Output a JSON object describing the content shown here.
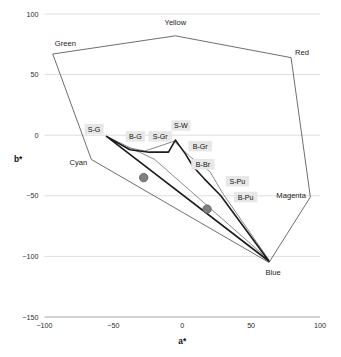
{
  "chart_data": {
    "type": "line",
    "title": "",
    "subtitle": "",
    "xlabel": "a*",
    "ylabel": "b*",
    "xlim": [
      -100,
      100
    ],
    "ylim": [
      -150,
      100
    ],
    "xticks": [
      -100,
      -50,
      0,
      50,
      100
    ],
    "xtick_labels": [
      "−100",
      "−50",
      "0",
      "50",
      "100"
    ],
    "yticks": [
      100,
      50,
      0,
      -50,
      -100,
      -150
    ],
    "ytick_labels": [
      "100",
      "50",
      "0",
      "−50",
      "−100",
      "−150"
    ],
    "grid": true,
    "legend": "none",
    "series": [
      {
        "name": "outer-gamut-boundary",
        "closed": true,
        "style": "thin-gray",
        "points": [
          [
            -94,
            67
          ],
          [
            -5,
            82
          ],
          [
            79,
            64
          ],
          [
            93,
            -51
          ],
          [
            63,
            -105
          ],
          [
            -66,
            -20
          ],
          [
            -94,
            67
          ]
        ]
      },
      {
        "name": "mid-gamut-boundary",
        "closed": true,
        "style": "medium-gray",
        "points": [
          [
            -55,
            -1
          ],
          [
            -41,
            -10
          ],
          [
            -27,
            -13
          ],
          [
            -6,
            -5
          ],
          [
            6,
            -18
          ],
          [
            20,
            -30
          ],
          [
            30,
            -49
          ],
          [
            63,
            -103
          ],
          [
            -20,
            -20
          ],
          [
            -55,
            -1
          ]
        ]
      },
      {
        "name": "inner-gamut-boundary",
        "closed": true,
        "style": "thick-black",
        "points": [
          [
            -55,
            -1
          ],
          [
            -38,
            -12
          ],
          [
            -24,
            -14
          ],
          [
            -10,
            -14
          ],
          [
            -5,
            -4
          ],
          [
            2,
            -15
          ],
          [
            8,
            -26
          ],
          [
            16,
            -36
          ],
          [
            28,
            -50
          ],
          [
            63,
            -104
          ],
          [
            -55,
            -1
          ]
        ]
      }
    ],
    "markers": [
      {
        "name": "sample-point-1",
        "x": -28,
        "y": -35,
        "color": "#808080"
      },
      {
        "name": "sample-point-2",
        "x": 18,
        "y": -61,
        "color": "#808080"
      }
    ],
    "vertex_labels": [
      {
        "name": "Green",
        "x": -94,
        "y": 72,
        "anchor": "start",
        "dx": 2,
        "dy": -2
      },
      {
        "name": "Yellow",
        "x": -5,
        "y": 88,
        "anchor": "middle",
        "dx": 0,
        "dy": -4
      },
      {
        "name": "Red",
        "x": 79,
        "y": 66,
        "anchor": "start",
        "dx": 4,
        "dy": 0
      },
      {
        "name": "Magenta",
        "x": 93,
        "y": -52,
        "anchor": "start",
        "dx": -34,
        "dy": 0
      },
      {
        "name": "Blue",
        "x": 63,
        "y": -108,
        "anchor": "middle",
        "dx": 4,
        "dy": 9
      },
      {
        "name": "Cyan",
        "x": -66,
        "y": -22,
        "anchor": "end",
        "dx": -4,
        "dy": 3
      }
    ],
    "boxed_labels": [
      {
        "name": "S-G",
        "label": "S-G",
        "x": -64,
        "y": 5
      },
      {
        "name": "B-G",
        "label": "B-G",
        "x": -34,
        "y": -1
      },
      {
        "name": "S-Gr",
        "label": "S-Gr",
        "x": -16,
        "y": -1
      },
      {
        "name": "S-W",
        "label": "S-W",
        "x": -1,
        "y": 8
      },
      {
        "name": "B-Gr",
        "label": "B-Gr",
        "x": 13,
        "y": -9
      },
      {
        "name": "B-Br",
        "label": "B-Br",
        "x": 15,
        "y": -24
      },
      {
        "name": "S-Pu",
        "label": "S-Pu",
        "x": 40,
        "y": -38
      },
      {
        "name": "B-Pu",
        "label": "B-Pu",
        "x": 46,
        "y": -51
      }
    ],
    "colors": {
      "grid": "#d6d6d6",
      "outer_line": "#545454",
      "mid_line": "#7d7d7d",
      "inner_line": "#1c1c1c",
      "marker": "#808080",
      "label_box": "#e7e7e7",
      "text": "#1a1a1a"
    }
  },
  "caption": {
    "fragment": ""
  }
}
